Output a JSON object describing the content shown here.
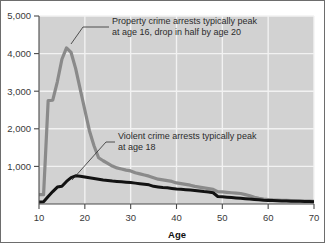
{
  "chart_data": {
    "type": "line",
    "title": "",
    "xlabel": "Age",
    "ylabel": "",
    "xlim": [
      10,
      70
    ],
    "ylim": [
      0,
      5000
    ],
    "grid": true,
    "legend": "none",
    "xticks": [
      "10",
      "20",
      "30",
      "40",
      "50",
      "60",
      "70"
    ],
    "xtick_values": [
      10,
      20,
      30,
      40,
      50,
      60,
      70
    ],
    "yticks": [
      "1,000",
      "2,000",
      "3,000",
      "4,000",
      "5,000"
    ],
    "ytick_values": [
      1000,
      2000,
      3000,
      4000,
      5000
    ],
    "x": [
      10,
      11,
      12,
      13,
      14,
      15,
      16,
      17,
      18,
      19,
      20,
      21,
      22,
      23,
      24,
      25,
      26,
      27,
      28,
      29,
      30,
      31,
      32,
      33,
      34,
      35,
      36,
      37,
      38,
      39,
      40,
      41,
      42,
      43,
      44,
      45,
      46,
      47,
      48,
      49,
      50,
      51,
      52,
      53,
      54,
      55,
      56,
      57,
      58,
      59,
      60,
      61,
      62,
      63,
      64,
      65,
      66,
      67,
      68,
      69,
      70
    ],
    "series": [
      {
        "name": "Property crime arrests",
        "color": "#8a8a8a",
        "values": [
          250,
          250,
          2750,
          2760,
          3250,
          3850,
          4150,
          4030,
          3600,
          3050,
          2500,
          1950,
          1550,
          1230,
          1150,
          1080,
          1010,
          960,
          930,
          900,
          880,
          830,
          800,
          770,
          740,
          700,
          660,
          640,
          620,
          600,
          560,
          540,
          520,
          500,
          470,
          450,
          430,
          410,
          390,
          330,
          320,
          310,
          300,
          290,
          280,
          250,
          220,
          180,
          150,
          130,
          120,
          110,
          105,
          100,
          95,
          90,
          85,
          80,
          78,
          75,
          70
        ]
      },
      {
        "name": "Violent crime arrests",
        "color": "#121212",
        "values": [
          55,
          60,
          200,
          330,
          450,
          470,
          600,
          700,
          750,
          740,
          720,
          700,
          680,
          660,
          640,
          625,
          610,
          600,
          590,
          580,
          570,
          555,
          540,
          525,
          510,
          470,
          455,
          440,
          430,
          415,
          400,
          390,
          380,
          370,
          360,
          345,
          330,
          320,
          300,
          200,
          190,
          180,
          170,
          160,
          150,
          140,
          130,
          120,
          110,
          100,
          95,
          90,
          85,
          80,
          78,
          75,
          72,
          70,
          68,
          65,
          60
        ]
      }
    ],
    "annotations": [
      {
        "id": "property-annotation",
        "line1": "Property crime arrests typically peak",
        "line2": "at age 16, drop in half by age 20",
        "points_to_series": "Property crime arrests"
      },
      {
        "id": "violent-annotation",
        "line1": "Violent crime arrests typically peak",
        "line2": "at age 18",
        "points_to_series": "Violent crime arrests"
      }
    ],
    "colors": {
      "plot_background": "#d2d2d2",
      "gridline": "#f2f2f2",
      "axis": "#4a4a4a",
      "property_line": "#8a8a8a",
      "violent_line": "#121212",
      "figure_border": "#6d6d6d"
    }
  }
}
